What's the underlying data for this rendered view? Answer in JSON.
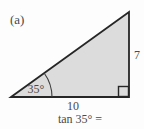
{
  "figure": {
    "part_label": "(a)",
    "angle_label": "35°",
    "base_label": "10",
    "height_label": "7",
    "caption": "tan 35° ="
  },
  "colors": {
    "triangle_fill": "#dcdcdc",
    "line": "#262626",
    "arc": "#3a3a3a",
    "text": "#4a4a4a",
    "background": "#fdfdfd"
  }
}
